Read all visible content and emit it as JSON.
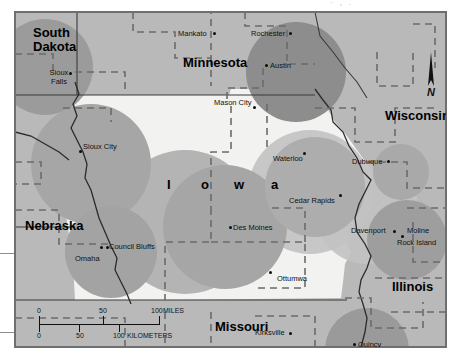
{
  "scan": {
    "header_fragment": "· , .",
    "margin_card": "blank-margin-card"
  },
  "map": {
    "title_letters": [
      "I",
      "o",
      "w",
      "a"
    ],
    "projection_note": "Iowa and surrounding states, shaded circular buffers",
    "colors": {
      "state_fill_iowa": "#f2f2f0",
      "state_fill_other": "#b9b9b9",
      "circle_light": "#c6c6c6",
      "circle_mid": "#a8a8a8",
      "circle_dark": "#8f8f8f",
      "border_solid": "#3a3a3a",
      "border_dashed": "#6b6b6b",
      "river": "#2b2b2b",
      "dot": "#0b0b0b"
    },
    "states": [
      {
        "name": "South Dakota",
        "x": 31,
        "y": 22,
        "size": "big",
        "lines": [
          "South",
          "Dakota"
        ]
      },
      {
        "name": "Minnesota",
        "x": 182,
        "y": 52,
        "size": "big",
        "lines": [
          "Minnesota"
        ]
      },
      {
        "name": "Wisconsin",
        "x": 384,
        "y": 106,
        "size": "big",
        "lines": [
          "Wisconsin"
        ]
      },
      {
        "name": "Nebraska",
        "x": 22,
        "y": 216,
        "size": "big",
        "lines": [
          "Nebraska"
        ]
      },
      {
        "name": "Illinois",
        "x": 391,
        "y": 277,
        "size": "big",
        "lines": [
          "Illinois"
        ]
      },
      {
        "name": "Missouri",
        "x": 214,
        "y": 317,
        "size": "big",
        "lines": [
          "Missouri"
        ]
      }
    ],
    "iowa_letters": [
      {
        "ch": "I",
        "x": 166,
        "y": 175
      },
      {
        "ch": "o",
        "x": 200,
        "y": 175
      },
      {
        "ch": "w",
        "x": 233,
        "y": 175
      },
      {
        "ch": "a",
        "x": 267,
        "y": 175
      }
    ],
    "cities": [
      {
        "name": "Mankato",
        "lx": 177,
        "ly": 27,
        "dx": 212,
        "dy": 30
      },
      {
        "name": "Rochester",
        "lx": 250,
        "ly": 27,
        "dx": 288,
        "dy": 30
      },
      {
        "name": "Austin",
        "lx": 269,
        "ly": 59,
        "dx": 264,
        "dy": 62
      },
      {
        "name": "Sioux Falls",
        "lx": 41,
        "ly": 73,
        "dx": 68,
        "dy": 70
      },
      {
        "name": "Mason City",
        "lx": 213,
        "ly": 96,
        "dx": 252,
        "dy": 104
      },
      {
        "name": "Sioux City",
        "lx": 82,
        "ly": 140,
        "dx": 78,
        "dy": 148
      },
      {
        "name": "Waterloo",
        "lx": 272,
        "ly": 152,
        "dx": 302,
        "dy": 150
      },
      {
        "name": "Dubuque",
        "lx": 351,
        "ly": 155,
        "dx": 386,
        "dy": 158
      },
      {
        "name": "Cedar Rapids",
        "lx": 288,
        "ly": 195,
        "dx": 338,
        "dy": 192
      },
      {
        "name": "Des Moines",
        "lx": 232,
        "ly": 221,
        "dx": 228,
        "dy": 224
      },
      {
        "name": "Davenport",
        "lx": 350,
        "ly": 225,
        "dx": 392,
        "dy": 228
      },
      {
        "name": "Moline",
        "lx": 404,
        "ly": 225,
        "dx": 398,
        "dy": 233
      },
      {
        "name": "Rock Island",
        "lx": 396,
        "ly": 237,
        "dx": 392,
        "dy": 233
      },
      {
        "name": "Council Bluffs",
        "lx": 106,
        "ly": 240,
        "dx": 103,
        "dy": 244
      },
      {
        "name": "Omaha",
        "lx": 74,
        "ly": 252,
        "dx": 98,
        "dy": 244
      },
      {
        "name": "Ottumwa",
        "lx": 276,
        "ly": 272,
        "dx": 268,
        "dy": 269
      },
      {
        "name": "Kirksville",
        "lx": 254,
        "ly": 326,
        "dx": 288,
        "dy": 330
      },
      {
        "name": "Quincy",
        "lx": 357,
        "ly": 344,
        "dx": 352,
        "dy": 341
      }
    ],
    "scale": {
      "miles_ticks": [
        "0",
        "50",
        "100"
      ],
      "miles_unit": "MILES",
      "km_ticks": [
        "0",
        "50",
        "100"
      ],
      "km_unit": "KILOMETERS"
    },
    "north_arrow": {
      "label": "N"
    }
  }
}
